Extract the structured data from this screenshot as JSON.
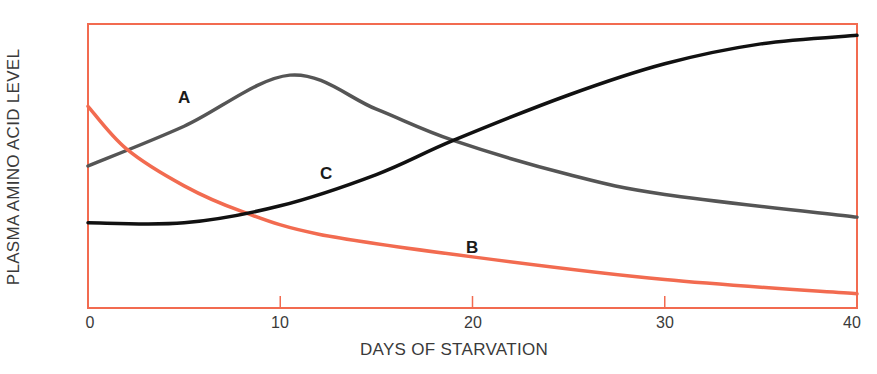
{
  "chart_data": {
    "type": "line",
    "title": "",
    "xlabel": "DAYS OF STARVATION",
    "ylabel": "PLASMA AMINO ACID LEVEL",
    "xlim": [
      0,
      40
    ],
    "ylim": [
      0,
      100
    ],
    "x_ticks": [
      0,
      10,
      20,
      30,
      40
    ],
    "y_ticks": [],
    "grid": false,
    "legend": "inline curve labels",
    "series": [
      {
        "name": "A",
        "color": "#555555",
        "x": [
          0,
          5,
          10.5,
          15,
          19,
          25,
          30,
          40
        ],
        "values": [
          50,
          64,
          82,
          70,
          59,
          47,
          40,
          32
        ]
      },
      {
        "name": "B",
        "color": "#f26b50",
        "x": [
          0,
          2,
          5,
          8,
          12,
          20,
          30,
          40
        ],
        "values": [
          71,
          56,
          43,
          34,
          26,
          18,
          10,
          5
        ]
      },
      {
        "name": "C",
        "color": "#111111",
        "x": [
          0,
          5,
          10,
          15,
          19,
          25,
          30,
          35,
          40
        ],
        "values": [
          30,
          30,
          36,
          47,
          59,
          75,
          86,
          93,
          96
        ]
      }
    ],
    "annotations": [
      {
        "text": "A",
        "x": 5,
        "y": 72
      },
      {
        "text": "B",
        "x": 20,
        "y": 23
      },
      {
        "text": "C",
        "x": 12.5,
        "y": 47
      }
    ]
  },
  "labels": {
    "x_axis": "DAYS OF STARVATION",
    "y_axis": "PLASMA AMINO ACID LEVEL",
    "ticks": [
      "0",
      "10",
      "20",
      "30",
      "40"
    ],
    "curve_a": "A",
    "curve_b": "B",
    "curve_c": "C"
  },
  "colors": {
    "frame": "#f26b50",
    "curve_a": "#555555",
    "curve_b": "#f26b50",
    "curve_c": "#111111"
  }
}
